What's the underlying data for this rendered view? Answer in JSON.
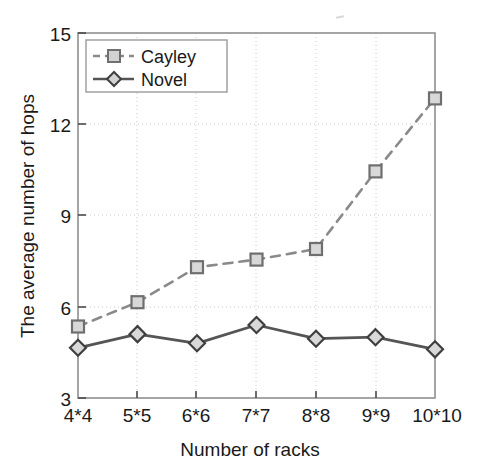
{
  "chart_data": {
    "type": "line",
    "title": "",
    "xlabel": "Number of racks",
    "ylabel": "The average number of hops",
    "categories": [
      "4*4",
      "5*5",
      "6*6",
      "7*7",
      "8*8",
      "9*9",
      "10*10"
    ],
    "ylim": [
      3,
      15
    ],
    "yticks": [
      3,
      6,
      9,
      12,
      15
    ],
    "ytick_labels": [
      "3",
      "6",
      "9",
      "12",
      "15"
    ],
    "grid": true,
    "legend_position": "top-left",
    "series": [
      {
        "name": "Cayley",
        "values": [
          5.35,
          6.15,
          7.3,
          7.55,
          7.9,
          10.45,
          12.85
        ],
        "line_style": "dashed",
        "marker": "square",
        "color": "#8a8a8a"
      },
      {
        "name": "Novel",
        "values": [
          4.65,
          5.1,
          4.8,
          5.4,
          4.95,
          5.0,
          4.6
        ],
        "line_style": "solid",
        "marker": "diamond",
        "color": "#555555"
      }
    ]
  },
  "axes": {
    "y_tick_0": "3",
    "y_tick_1": "6",
    "y_tick_2": "9",
    "y_tick_3": "12",
    "y_tick_4": "15",
    "x_tick_0": "4*4",
    "x_tick_1": "5*5",
    "x_tick_2": "6*6",
    "x_tick_3": "7*7",
    "x_tick_4": "8*8",
    "x_tick_5": "9*9",
    "x_tick_6": "10*10",
    "x_title": "Number of racks",
    "y_title": "The average number of hops"
  },
  "legend": {
    "entry_0": "Cayley",
    "entry_1": "Novel"
  },
  "colors": {
    "cayley": "#8a8a8a",
    "novel": "#555555",
    "axis": "#8f8f8f",
    "grid": "#c8c8c8",
    "text": "#1a1a1a",
    "background": "#ffffff"
  }
}
